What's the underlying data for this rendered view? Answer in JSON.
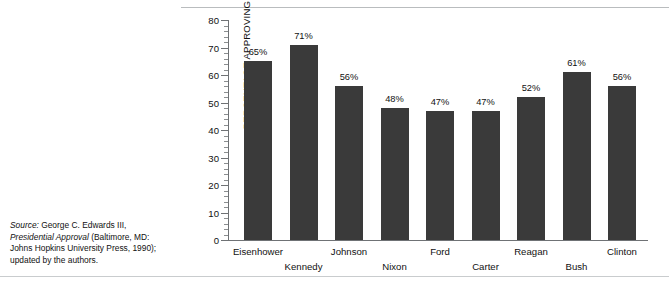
{
  "chart_data": {
    "type": "bar",
    "title": "",
    "xlabel": "",
    "ylabel": "PERCENTAGE APPROVING",
    "ylim": [
      0,
      80
    ],
    "ytick_step": 10,
    "yticks": [
      0,
      10,
      20,
      30,
      40,
      50,
      60,
      70,
      80
    ],
    "ytick_labels": [
      "0",
      "10",
      "20",
      "30",
      "40",
      "50",
      "60",
      "70",
      "80"
    ],
    "grid": false,
    "legend": null,
    "value_label_suffix": "%",
    "bar_color": "#3a3a3a",
    "axis_color": "#6f7275",
    "categories": [
      "Eisenhower",
      "Kennedy",
      "Johnson",
      "Nixon",
      "Ford",
      "Carter",
      "Reagan",
      "Bush",
      "Clinton"
    ],
    "values": [
      65,
      71,
      56,
      48,
      47,
      47,
      52,
      61,
      56
    ],
    "value_labels": [
      "65%",
      "71%",
      "56%",
      "48%",
      "47%",
      "47%",
      "52%",
      "61%",
      "56%"
    ],
    "label_rows": [
      "a",
      "b",
      "a",
      "b",
      "a",
      "b",
      "a",
      "b",
      "a"
    ]
  },
  "source": {
    "prefix": "Source:",
    "line1_rest": " George C. Edwards III,",
    "title_italic": "Presidential Approval",
    "line2_rest": " (Baltimore, MD:",
    "line3": "Johns Hopkins University Press, 1990);",
    "line4": "updated by the authors."
  }
}
